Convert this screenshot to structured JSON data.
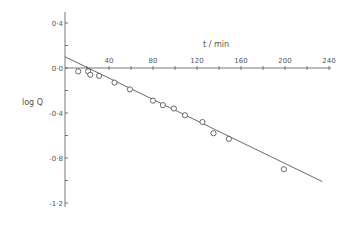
{
  "chart_data": {
    "type": "scatter",
    "title": "",
    "xlabel": "t / min",
    "ylabel": "log Q",
    "xlim": [
      0,
      240
    ],
    "ylim": [
      -1.2,
      0.4
    ],
    "x_ticks_major": [
      40,
      80,
      120,
      160,
      200,
      240
    ],
    "x_ticks_minor_step": 20,
    "x_tick_labels": [
      "40",
      "80",
      "120",
      "160",
      "200",
      "240"
    ],
    "y_ticks_major": [
      0.4,
      0.0,
      -0.4,
      -0.8,
      -1.2
    ],
    "y_ticks_minor_step": 0.2,
    "y_tick_labels": [
      "0·4",
      "0·0",
      "-0·4",
      "-0·8",
      "-1·2"
    ],
    "grid": false,
    "legend": null,
    "series": [
      {
        "name": "measured",
        "marker": "open-circle",
        "x": [
          12,
          21,
          23,
          31,
          45,
          59,
          80,
          89,
          99,
          109,
          125,
          135,
          149,
          199
        ],
        "y": [
          -0.03,
          -0.03,
          -0.06,
          -0.07,
          -0.13,
          -0.19,
          -0.29,
          -0.33,
          -0.36,
          -0.42,
          -0.48,
          -0.58,
          -0.63,
          -0.9
        ]
      },
      {
        "name": "linear fit",
        "marker": "line",
        "x": [
          0,
          234
        ],
        "y": [
          0.1,
          -1.01
        ]
      }
    ]
  }
}
